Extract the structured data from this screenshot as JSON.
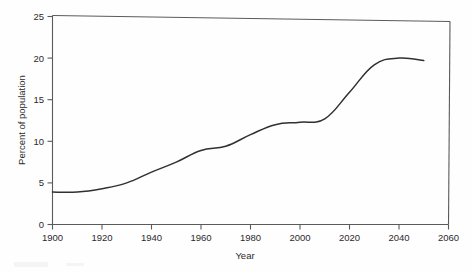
{
  "chart_data": {
    "type": "line",
    "title": "",
    "xlabel": "Year",
    "ylabel": "Percent of population",
    "xlim": [
      1900,
      2060
    ],
    "ylim": [
      0,
      25
    ],
    "xticks": [
      1900,
      1920,
      1940,
      1960,
      1980,
      2000,
      2020,
      2040,
      2060
    ],
    "yticks": [
      0,
      5,
      10,
      15,
      20,
      25
    ],
    "grid": false,
    "legend": "none",
    "x": [
      1900,
      1910,
      1920,
      1930,
      1940,
      1950,
      1960,
      1970,
      1980,
      1990,
      2000,
      2010,
      2020,
      2030,
      2040,
      2050
    ],
    "series": [
      {
        "name": "Percent of population",
        "values": [
          3.9,
          3.9,
          4.3,
          5.0,
          6.3,
          7.5,
          8.9,
          9.4,
          10.8,
          12.0,
          12.3,
          12.7,
          15.9,
          19.2,
          20.0,
          19.7
        ]
      }
    ]
  },
  "axes": {
    "x_title": "Year",
    "y_title": "Percent of population",
    "x_tick_labels": [
      "1900",
      "1920",
      "1940",
      "1960",
      "1980",
      "2000",
      "2020",
      "2040",
      "2060"
    ],
    "y_tick_labels": [
      "0",
      "5",
      "10",
      "15",
      "20",
      "25"
    ]
  },
  "style": {
    "line_color": "#303030",
    "frame_color": "#5a5a5a",
    "text_color": "#2b2b2b",
    "background": "#fefefe"
  }
}
